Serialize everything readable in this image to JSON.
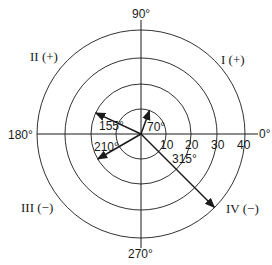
{
  "diagram": {
    "type": "polar-angle-diagram",
    "center": {
      "x": 141,
      "y": 134
    },
    "rings": [
      {
        "value": 10,
        "label": "10",
        "radius": 25
      },
      {
        "value": 20,
        "label": "20",
        "radius": 50
      },
      {
        "value": 30,
        "label": "30",
        "radius": 76
      },
      {
        "value": 40,
        "label": "40",
        "radius": 104
      }
    ],
    "axis_labels": {
      "deg0": "0°",
      "deg90": "90°",
      "deg180": "180°",
      "deg270": "270°"
    },
    "quadrants": {
      "q1": "I (+)",
      "q2": "II (+)",
      "q3": "III (−)",
      "q4": "IV (−)"
    },
    "vectors": [
      {
        "angle": 70,
        "label": "70°",
        "magnitude": 10
      },
      {
        "angle": 155,
        "label": "155°",
        "magnitude": 20
      },
      {
        "angle": 210,
        "label": "210°",
        "magnitude": 20
      },
      {
        "angle": 315,
        "label": "315°",
        "magnitude": 40
      }
    ],
    "line_color": "#1a1a1a"
  }
}
